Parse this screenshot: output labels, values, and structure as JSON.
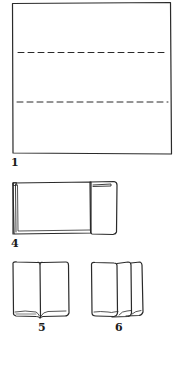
{
  "diagram": {
    "type": "folding-instructions",
    "stroke_color": "#2a2a2a",
    "background": "#ffffff",
    "steps": [
      {
        "label": "1",
        "description": "square sheet with two horizontal dashed fold lines"
      },
      {
        "label": "4",
        "description": "sheet folded into a horizontal strip with a folded panel on the right"
      },
      {
        "label": "5",
        "description": "two vertical panels folded side by side"
      },
      {
        "label": "6",
        "description": "three overlapping vertical panels fanned out"
      }
    ]
  }
}
